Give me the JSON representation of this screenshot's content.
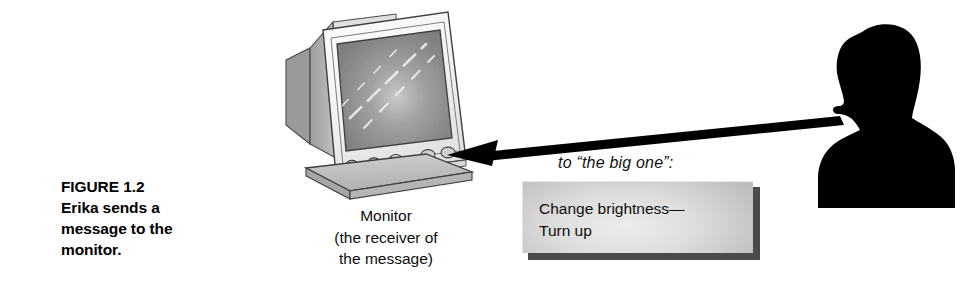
{
  "figure": {
    "caption_lines": [
      "FIGURE 1.2",
      "Erika sends a",
      "message to the",
      "monitor."
    ]
  },
  "monitor": {
    "label_lines": [
      "Monitor",
      "(the receiver of",
      "the message)"
    ]
  },
  "annotation": {
    "big_one_text": "to “the big one”:"
  },
  "message_box": {
    "lines": [
      "Change brightness—",
      "Turn up"
    ]
  },
  "icons": {
    "monitor": "crt-monitor-icon",
    "person": "person-silhouette-icon",
    "arrow": "message-arrow-icon"
  },
  "colors": {
    "background": "#ffffff",
    "text": "#000000",
    "silhouette": "#000000",
    "arrow": "#000000",
    "box_fill": "#d8d8d8",
    "box_shadow": "#4a4a4a",
    "monitor_bezel": "#f2f2f2",
    "monitor_screen": "#8a8a8a",
    "monitor_case": "#a8a8a8",
    "monitor_base": "#bdbdbd"
  }
}
